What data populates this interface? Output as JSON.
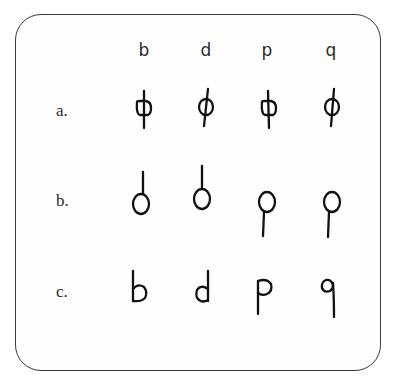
{
  "figure": {
    "columns": [
      "b",
      "d",
      "p",
      "q"
    ],
    "rows": [
      {
        "label": "a.",
        "description": "circle with vertical stroke passing through center"
      },
      {
        "label": "b.",
        "description": "circle with stroke attached above (b, d) or below (p, q)"
      },
      {
        "label": "c.",
        "description": "handwritten letter forms"
      }
    ],
    "row_c_letters": [
      "b",
      "d",
      "p",
      "q"
    ],
    "stroke_color": "#111111",
    "border_color": "#3a3a3a"
  }
}
